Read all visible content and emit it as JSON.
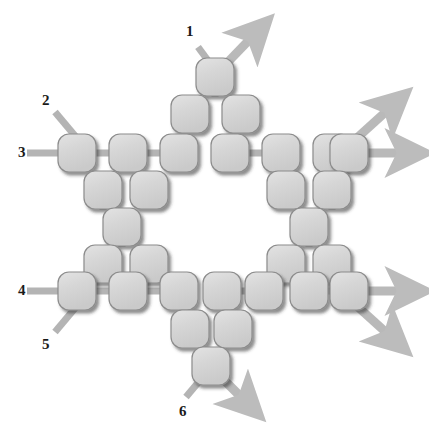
{
  "diagram": {
    "type": "node-tile-diagram",
    "canvas": {
      "width": 429,
      "height": 445,
      "background": "#ffffff"
    },
    "colors": {
      "tile_fill": "#d4d4d4",
      "tile_fill_light": "#dedede",
      "tile_stroke": "#8c8c8c",
      "tile_shadow": "#4d4d4d",
      "connector": "#b4b4b4",
      "line": "#b4b4b4",
      "arrow": "#b9b9b9",
      "label_text": "#1a1a1a"
    },
    "tile": {
      "size": 38,
      "radius": 11,
      "pitch": 51
    },
    "labels": [
      {
        "id": "1",
        "text": "1",
        "x": 186,
        "y": 24,
        "anchor": "top-center",
        "port": "top"
      },
      {
        "id": "2",
        "text": "2",
        "x": 42,
        "y": 93,
        "anchor": "left",
        "port": "upper-left-diagonal"
      },
      {
        "id": "3",
        "text": "3",
        "x": 18,
        "y": 145,
        "anchor": "left",
        "port": "left-horizontal-upper"
      },
      {
        "id": "4",
        "text": "4",
        "x": 18,
        "y": 283,
        "anchor": "left",
        "port": "left-horizontal-lower"
      },
      {
        "id": "5",
        "text": "5",
        "x": 42,
        "y": 337,
        "anchor": "left",
        "port": "lower-left-diagonal"
      },
      {
        "id": "6",
        "text": "6",
        "x": 179,
        "y": 404,
        "anchor": "bottom-center",
        "port": "bottom"
      }
    ],
    "input_lines": [
      {
        "for_label": "1",
        "from": [
          198,
          47
        ],
        "to": [
          215,
          70
        ],
        "kind": "diagonal"
      },
      {
        "for_label": "2",
        "from": [
          55,
          112
        ],
        "to": [
          76,
          137
        ],
        "kind": "diagonal"
      },
      {
        "for_label": "3",
        "from": [
          27,
          153
        ],
        "to": [
          62,
          153
        ],
        "kind": "horizontal"
      },
      {
        "for_label": "4",
        "from": [
          27,
          291
        ],
        "to": [
          62,
          291
        ],
        "kind": "horizontal"
      },
      {
        "for_label": "5",
        "from": [
          55,
          332
        ],
        "to": [
          76,
          307
        ],
        "kind": "diagonal"
      },
      {
        "for_label": "6",
        "from": [
          186,
          397
        ],
        "to": [
          207,
          372
        ],
        "kind": "diagonal"
      }
    ],
    "output_arrows": [
      {
        "id": "out-top-right-diagonal",
        "from": [
          226,
          64
        ],
        "to": [
          253,
          36
        ],
        "kind": "diagonal"
      },
      {
        "id": "out-upper-right-diagonal",
        "from": [
          358,
          137
        ],
        "to": [
          390,
          108
        ],
        "kind": "diagonal"
      },
      {
        "id": "out-upper-right-horizontal",
        "from": [
          368,
          153
        ],
        "to": [
          404,
          153
        ],
        "kind": "horizontal"
      },
      {
        "id": "out-lower-right-horizontal",
        "from": [
          368,
          291
        ],
        "to": [
          404,
          291
        ],
        "kind": "horizontal"
      },
      {
        "id": "out-lower-right-diagonal",
        "from": [
          358,
          307
        ],
        "to": [
          390,
          336
        ],
        "kind": "diagonal"
      },
      {
        "id": "out-bottom-diagonal",
        "from": [
          216,
          372
        ],
        "to": [
          244,
          400
        ],
        "kind": "diagonal"
      }
    ],
    "tiles": [
      {
        "id": "t-apex-top",
        "x": 196,
        "y": 58,
        "name": "tile-top-apex"
      },
      {
        "id": "t-r2-c1",
        "x": 171,
        "y": 95,
        "name": "tile-upper-pyramid-left"
      },
      {
        "id": "t-r2-c2",
        "x": 222,
        "y": 95,
        "name": "tile-upper-pyramid-right"
      },
      {
        "id": "t-row-top-1",
        "x": 58,
        "y": 134,
        "name": "tile-top-row-1"
      },
      {
        "id": "t-row-top-2",
        "x": 109,
        "y": 134,
        "name": "tile-top-row-2"
      },
      {
        "id": "t-row-top-3",
        "x": 160,
        "y": 134,
        "name": "tile-top-row-3"
      },
      {
        "id": "t-row-top-4",
        "x": 211,
        "y": 134,
        "name": "tile-top-row-4"
      },
      {
        "id": "t-row-top-5",
        "x": 262,
        "y": 134,
        "name": "tile-top-row-5"
      },
      {
        "id": "t-row-top-6",
        "x": 313,
        "y": 134,
        "name": "tile-top-row-6"
      },
      {
        "id": "t-row-top-7",
        "x": 330,
        "y": 134,
        "name": "tile-top-row-7"
      },
      {
        "id": "t-ul-a",
        "x": 84,
        "y": 171,
        "name": "tile-upper-left-inner-a"
      },
      {
        "id": "t-ul-b",
        "x": 130,
        "y": 171,
        "name": "tile-upper-left-inner-b"
      },
      {
        "id": "t-ur-a",
        "x": 267,
        "y": 171,
        "name": "tile-upper-right-inner-a"
      },
      {
        "id": "t-ur-b",
        "x": 313,
        "y": 171,
        "name": "tile-upper-right-inner-b"
      },
      {
        "id": "t-l-mid",
        "x": 103,
        "y": 208,
        "name": "tile-left-middle"
      },
      {
        "id": "t-r-mid",
        "x": 290,
        "y": 208,
        "name": "tile-right-middle"
      },
      {
        "id": "t-ll-a",
        "x": 84,
        "y": 245,
        "name": "tile-lower-left-inner-a"
      },
      {
        "id": "t-ll-b",
        "x": 130,
        "y": 245,
        "name": "tile-lower-left-inner-b"
      },
      {
        "id": "t-lr-a",
        "x": 267,
        "y": 245,
        "name": "tile-lower-right-inner-a"
      },
      {
        "id": "t-lr-b",
        "x": 313,
        "y": 245,
        "name": "tile-lower-right-inner-b"
      },
      {
        "id": "t-row-bot-1",
        "x": 58,
        "y": 272,
        "name": "tile-bottom-row-1"
      },
      {
        "id": "t-row-bot-2",
        "x": 109,
        "y": 272,
        "name": "tile-bottom-row-2"
      },
      {
        "id": "t-row-bot-3",
        "x": 160,
        "y": 272,
        "name": "tile-bottom-row-3"
      },
      {
        "id": "t-row-bot-4",
        "x": 203,
        "y": 272,
        "name": "tile-bottom-row-4"
      },
      {
        "id": "t-row-bot-5",
        "x": 245,
        "y": 272,
        "name": "tile-bottom-row-5"
      },
      {
        "id": "t-row-bot-6",
        "x": 290,
        "y": 272,
        "name": "tile-bottom-row-6"
      },
      {
        "id": "t-row-bot-7",
        "x": 330,
        "y": 272,
        "name": "tile-bottom-row-7"
      },
      {
        "id": "t-b2-c1",
        "x": 171,
        "y": 310,
        "name": "tile-lower-pyramid-left"
      },
      {
        "id": "t-b2-c2",
        "x": 214,
        "y": 310,
        "name": "tile-lower-pyramid-right"
      },
      {
        "id": "t-apex-bottom",
        "x": 192,
        "y": 347,
        "name": "tile-bottom-apex"
      }
    ],
    "connectors": [
      {
        "from": "t-row-top-1",
        "to": "t-row-top-2",
        "orient": "h"
      },
      {
        "from": "t-row-top-2",
        "to": "t-row-top-3",
        "orient": "h"
      },
      {
        "from": "t-row-top-4",
        "to": "t-row-top-5",
        "orient": "h"
      },
      {
        "from": "t-row-top-6",
        "to": "t-row-top-7",
        "orient": "h"
      },
      {
        "from": "t-row-bot-1",
        "to": "t-row-bot-2",
        "orient": "h"
      },
      {
        "from": "t-row-bot-2",
        "to": "t-row-bot-3",
        "orient": "h"
      },
      {
        "from": "t-row-bot-4",
        "to": "t-row-bot-5",
        "orient": "h"
      },
      {
        "from": "t-row-bot-6",
        "to": "t-row-bot-7",
        "orient": "h"
      },
      {
        "from": "t-apex-top",
        "to": "t-r2-c1",
        "orient": "v"
      },
      {
        "from": "t-ul-a",
        "to": "t-l-mid",
        "orient": "v"
      },
      {
        "from": "t-ur-b",
        "to": "t-r-mid",
        "orient": "v"
      },
      {
        "from": "t-l-mid",
        "to": "t-ll-b",
        "orient": "v"
      },
      {
        "from": "t-r-mid",
        "to": "t-lr-a",
        "orient": "v"
      }
    ]
  }
}
